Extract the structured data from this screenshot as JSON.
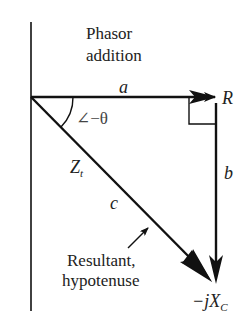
{
  "diagram": {
    "title_line1": "Phasor",
    "title_line2": "addition",
    "labels": {
      "a": "a",
      "R": "R",
      "b": "b",
      "c": "c",
      "angle": "∠−θ",
      "Zt_main": "Z",
      "Zt_sub": "t",
      "jXc_main": "−jX",
      "jXc_sub": "C",
      "note_line1": "Resultant,",
      "note_line2": "hypotenuse"
    },
    "colors": {
      "stroke": "#111111",
      "text": "#222222",
      "background": "#ffffff"
    }
  }
}
